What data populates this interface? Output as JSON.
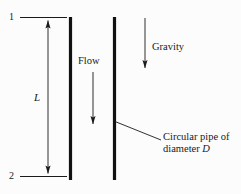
{
  "figure": {
    "background_color": "#fcfcfc",
    "line_color": "#1a1a1a",
    "pipe_wall_color": "#111111",
    "width": 241,
    "height": 194
  },
  "labels": {
    "station_top": "1",
    "station_bottom": "2",
    "length_symbol": "L",
    "flow": "Flow",
    "gravity": "Gravity",
    "callout_line1": "Circular pipe of",
    "callout_line2_prefix": "diameter ",
    "callout_line2_symbol": "D"
  },
  "icons": {
    "flow_arrow": "down-arrow-icon",
    "gravity_arrow": "down-arrow-icon",
    "dimension_arrow_top": "up-arrow-icon",
    "dimension_arrow_bottom": "down-arrow-icon",
    "callout_leader": "leader-line-icon"
  },
  "geometry": {
    "pipe_wall_left_x": 70.5,
    "pipe_wall_right_x": 114.5,
    "pipe_top_y": 17,
    "pipe_bottom_y": 180,
    "dimension_line_x": 48,
    "extension_line_start_x": 20,
    "extension_line_end_x": 67,
    "flow_arrow_x": 93,
    "flow_arrow_top_y": 72,
    "flow_arrow_bottom_y": 128,
    "gravity_arrow_x": 145,
    "gravity_arrow_top_y": 18,
    "gravity_arrow_bottom_y": 72,
    "leader_start_x": 115,
    "leader_start_y": 122,
    "leader_end_x": 161,
    "leader_end_y": 140
  }
}
